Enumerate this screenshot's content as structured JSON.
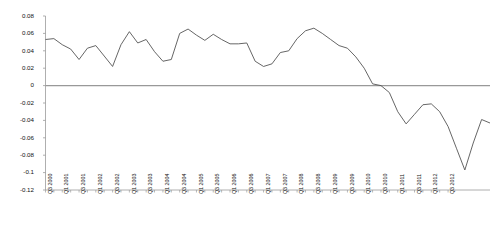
{
  "chart_data": {
    "type": "line",
    "title": "",
    "subtitle": "",
    "xlabel": "",
    "ylabel": "",
    "grid": false,
    "legend": null,
    "legend_position": "none",
    "ylim": [
      -0.12,
      0.08
    ],
    "yticks": [
      0.08,
      0.06,
      0.04,
      0.02,
      0,
      -0.02,
      -0.04,
      -0.06,
      -0.08,
      -0.1,
      -0.12
    ],
    "ytick_labels": [
      "0.08",
      "0.06",
      "0.04",
      "0.02",
      "0",
      "-0.02",
      "-0.04",
      "-0.06",
      "-0.08",
      "-0.1",
      "-0.12"
    ],
    "zero_line": 0,
    "line_color": "#555555",
    "zero_line_color": "#999999",
    "axis_color": "#9a9a9a",
    "categories": [
      "Q3 2000",
      "Q4 2000",
      "Q1 2001",
      "Q2 2001",
      "Q3 2001",
      "Q4 2001",
      "Q1 2002",
      "Q2 2002",
      "Q3 2002",
      "Q4 2002",
      "Q1 2003",
      "Q2 2003",
      "Q3 2003",
      "Q4 2003",
      "Q1 2004",
      "Q2 2004",
      "Q3 2004",
      "Q4 2004",
      "Q1 2005",
      "Q2 2005",
      "Q3 2005",
      "Q4 2005",
      "Q1 2006",
      "Q2 2006",
      "Q3 2006",
      "Q4 2006",
      "Q1 2007",
      "Q2 2007",
      "Q3 2007",
      "Q4 2007",
      "Q1 2008",
      "Q2 2008",
      "Q3 2008",
      "Q4 2008",
      "Q1 2009",
      "Q2 2009",
      "Q3 2009",
      "Q4 2009",
      "Q1 2010",
      "Q2 2010",
      "Q3 2010",
      "Q4 2010",
      "Q1 2011",
      "Q2 2011",
      "Q3 2011",
      "Q4 2011",
      "Q1 2012",
      "Q2 2012",
      "Q3 2012"
    ],
    "xtick_labels_shown": [
      "Q3 2000",
      "Q1 2001",
      "Q3 2001",
      "Q1 2002",
      "Q3 2002",
      "Q1 2003",
      "Q3 2003",
      "Q1 2004",
      "Q3 2004",
      "Q1 2005",
      "Q3 2005",
      "Q1 2006",
      "Q3 2006",
      "Q1 2007",
      "Q3 2007",
      "Q1 2008",
      "Q3 2008",
      "Q1 2009",
      "Q3 2009",
      "Q1 2010",
      "Q3 2010",
      "Q1 2011",
      "Q3 2011",
      "Q1 2012",
      "Q3 2012"
    ],
    "values": [
      0.053,
      0.054,
      0.047,
      0.042,
      0.03,
      0.043,
      0.046,
      0.034,
      0.022,
      0.047,
      0.062,
      0.049,
      0.053,
      0.039,
      0.028,
      0.03,
      0.06,
      0.065,
      0.058,
      0.052,
      0.059,
      0.053,
      0.048,
      0.048,
      0.049,
      0.028,
      0.022,
      0.025,
      0.038,
      0.04,
      0.054,
      0.063,
      0.066,
      0.06,
      0.053,
      0.046,
      0.043,
      0.033,
      0.02,
      0.002,
      0.0,
      -0.008,
      -0.03,
      -0.044,
      -0.033,
      -0.022,
      -0.021,
      -0.03,
      -0.047
    ],
    "values_tail": [
      -0.072,
      -0.097,
      -0.066,
      -0.039,
      -0.043
    ]
  }
}
